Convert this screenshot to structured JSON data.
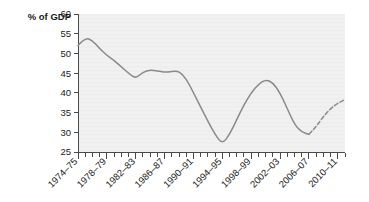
{
  "chart_data": {
    "type": "line",
    "title": "",
    "subtitle": "",
    "xlabel": "",
    "ylabel": "% of GDP",
    "ylim": [
      25,
      60
    ],
    "ytick_values": [
      25,
      30,
      35,
      40,
      45,
      50,
      55,
      60
    ],
    "ytick_labels": [
      "25",
      "30",
      "35",
      "40",
      "45",
      "50",
      "55",
      "60"
    ],
    "grid": false,
    "legend": "none",
    "x_minor_ticks": true,
    "xtick_labels": [
      "1974–75",
      "1978–79",
      "1982–83",
      "1986–87",
      "1990–91",
      "1994–95",
      "1998–99",
      "2002–03",
      "2006–07",
      "2010–11"
    ],
    "xtick_indices": [
      0,
      4,
      8,
      12,
      16,
      20,
      24,
      28,
      32,
      36
    ],
    "x": [
      "1974-75",
      "1975-76",
      "1976-77",
      "1977-78",
      "1978-79",
      "1979-80",
      "1980-81",
      "1981-82",
      "1982-83",
      "1983-84",
      "1984-85",
      "1985-86",
      "1986-87",
      "1987-88",
      "1988-89",
      "1989-90",
      "1990-91",
      "1991-92",
      "1992-93",
      "1993-94",
      "1994-95",
      "1995-96",
      "1996-97",
      "1997-98",
      "1998-99",
      "1999-00",
      "2000-01",
      "2001-02",
      "2002-03",
      "2003-04",
      "2004-05",
      "2005-06",
      "2006-07",
      "2007-08",
      "2008-09",
      "2009-10",
      "2010-11",
      "2011-12"
    ],
    "series": [
      {
        "name": "Public sector net debt",
        "color": "#8a8a8a",
        "style": "solid-then-dashed",
        "forecast_starts_at_index": 32,
        "values": [
          52.0,
          54.0,
          53.3,
          51.2,
          49.5,
          48.2,
          46.6,
          45.0,
          43.6,
          45.3,
          45.8,
          45.6,
          45.2,
          45.4,
          45.5,
          43.6,
          40.0,
          36.4,
          32.8,
          29.4,
          27.0,
          29.4,
          33.2,
          37.0,
          40.0,
          42.2,
          43.4,
          42.6,
          40.0,
          36.0,
          32.0,
          30.0,
          29.5,
          31.4,
          34.0,
          36.0,
          37.4,
          38.3
        ]
      }
    ],
    "annotations": []
  },
  "axis": {
    "y_title": "% of GDP"
  }
}
